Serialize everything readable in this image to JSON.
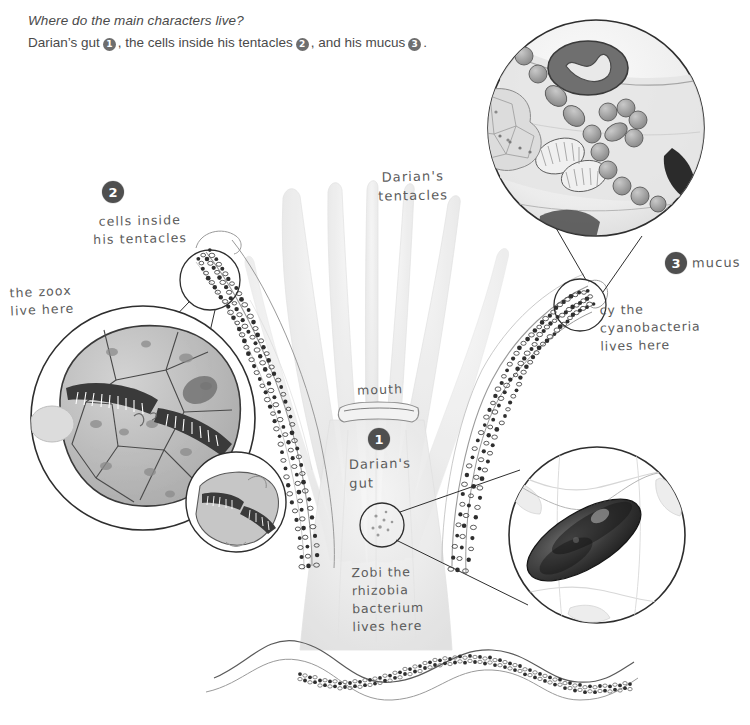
{
  "header": {
    "question": "Where do the main characters live?",
    "answer_pre": "Darian’s gut",
    "answer_mid": ", the cells inside his tentacles",
    "answer_post": ", and his mucus",
    "answer_end": ".",
    "badge1": "1",
    "badge2": "2",
    "badge3": "3"
  },
  "badges": {
    "one": "1",
    "two": "2",
    "three": "3"
  },
  "labels": {
    "tentacles": "Darian's\ntentacles",
    "mouth": "mouth",
    "gut": "Darian's\ngut",
    "cells_inside": "cells inside\nhis tentacles",
    "zoox": "the zoox\nlive here",
    "mucus": "mucus",
    "cyanobacteria": "cy the\ncyanobacteria\nlives here",
    "rhizobia": "Zobi the\nrhizobia\nbacterium\nlives here"
  },
  "colors": {
    "badge_fill": "#4f4f4f",
    "badge_text": "#ffffff",
    "header_text": "#4a4a4a",
    "pencil": "#5b5b5b",
    "ink": "#2e2e2e",
    "background": "#ffffff"
  },
  "figure": {
    "subject_name": "Darian",
    "insets": [
      {
        "name": "mucus-inset",
        "content": "bacteria chains and cells in mucus layer",
        "linked_badge": "3"
      },
      {
        "name": "tentacle-cells-inset",
        "content": "tentacle cells containing zooxanthellae",
        "linked_badge": "2"
      },
      {
        "name": "zoox-detail-inset",
        "content": "single zooxanthella detail"
      },
      {
        "name": "gut-bacterium-inset",
        "content": "rhizobia bacterium in gut",
        "linked_badge": "1"
      }
    ]
  }
}
